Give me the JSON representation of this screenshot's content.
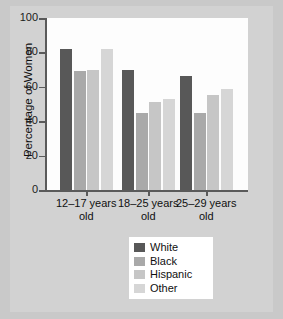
{
  "chart_data": {
    "type": "bar",
    "title": "",
    "xlabel": "",
    "ylabel": "Percentage of Women",
    "ylim": [
      0,
      100
    ],
    "yticks": [
      0,
      20,
      40,
      60,
      80,
      100
    ],
    "grid": false,
    "legend_position": "bottom-center",
    "categories": [
      "12–17 years old",
      "18–25 years old",
      "25–29 years old"
    ],
    "category_lines": [
      [
        "12–17 years",
        "old"
      ],
      [
        "18–25 years",
        "old"
      ],
      [
        "25–29 years",
        "old"
      ]
    ],
    "series": [
      {
        "name": "White",
        "color": "#585858",
        "values": [
          82,
          70,
          66
        ]
      },
      {
        "name": "Black",
        "color": "#a9a9a9",
        "values": [
          69,
          45,
          45
        ]
      },
      {
        "name": "Hispanic",
        "color": "#c6c6c6",
        "values": [
          70,
          51,
          55
        ]
      },
      {
        "name": "Other",
        "color": "#d6d6d6",
        "values": [
          82,
          53,
          59
        ]
      }
    ]
  },
  "axis": {
    "y_title": "Percentage of Women",
    "y_tick_labels": [
      "100",
      "80",
      "60",
      "40",
      "20",
      "0"
    ]
  },
  "legend": {
    "items": [
      {
        "label": "White",
        "color": "#585858"
      },
      {
        "label": "Black",
        "color": "#a9a9a9"
      },
      {
        "label": "Hispanic",
        "color": "#c6c6c6"
      },
      {
        "label": "Other",
        "color": "#d6d6d6"
      }
    ]
  }
}
